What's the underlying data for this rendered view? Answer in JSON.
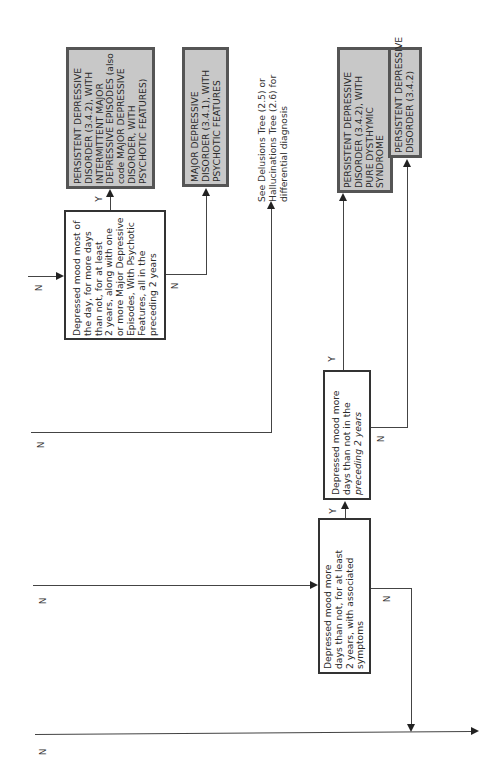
{
  "diagram": {
    "orientation": "rotated-90-ccw",
    "terminals": {
      "pdd_intermittent_mde": [
        "PERSISTENT DEPRESSIVE",
        "DISORDER (3.4.2), WITH",
        "INTERMITTENT MAJOR",
        "DEPRESSIVE EPISODES (also",
        "code MAJOR DEPRESSIVE",
        "DISORDER, WITH",
        "PSYCHOTIC FEATURES)"
      ],
      "mdd_psychotic": [
        "MAJOR DEPRESSIVE",
        "DISORDER (3.4.1), WITH",
        "PSYCHOTIC FEATURES"
      ],
      "pdd_pure_dysthymic": [
        "PERSISTENT DEPRESSIVE",
        "DISORDER (3.4.2), WITH",
        "PURE DYSTHYMIC",
        "SYNDROME"
      ],
      "pdd": [
        "PERSISTENT DEPRESSIVE",
        "DISORDER (3.4.2)"
      ]
    },
    "decisions": {
      "d1": [
        "Depressed mood most of",
        "the day, for more days",
        "than not, for at least",
        "2 years, along with one",
        "or more Major Depressive",
        "Episodes, With Psychotic",
        "Features, all in the",
        "preceding 2 years"
      ],
      "d2": [
        "Depressed mood more",
        "days than not in the",
        "preceding 2 years"
      ],
      "d3": [
        "Depressed mood more",
        "days than not, for at least",
        "2 years, with associated",
        "symptoms"
      ]
    },
    "note": [
      "See Delusions Tree (2.5) or",
      "Hallucinations Tree (2.6) for",
      "differential diagnosis"
    ],
    "labels": {
      "yes": "Y",
      "no": "N"
    }
  }
}
